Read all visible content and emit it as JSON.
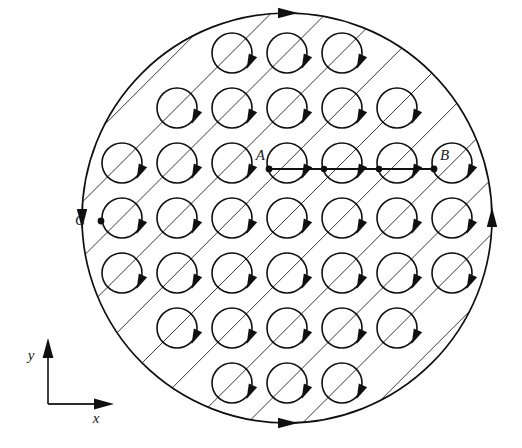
{
  "figure": {
    "background_color": "#ffffff",
    "ink_color": "#101010",
    "hatch_color": "#3a3a3a",
    "width": 522,
    "height": 448
  },
  "boundary": {
    "name": "large-circle",
    "center_x": 287,
    "center_y": 218,
    "radius": 205,
    "stroke_width": 1.7,
    "direction": "arrowheads at top, bottom, left and right of rim",
    "arrowheads": [
      {
        "at": "top",
        "angle_deg": 270,
        "points": "right"
      },
      {
        "at": "bottom",
        "angle_deg": 90,
        "points": "right"
      },
      {
        "at": "left",
        "angle_deg": 180,
        "points": "down"
      },
      {
        "at": "right",
        "angle_deg": 0,
        "points": "up"
      }
    ]
  },
  "hatching": {
    "name": "diagonal-field-lines",
    "slope": "-1",
    "angle_deg": 45,
    "perpendicular_spacing": 39,
    "count": 11,
    "stroke_width": 1
  },
  "loops": {
    "name": "current-loop-grid",
    "radius": 20,
    "spacing_x": 55,
    "spacing_y": 55,
    "origin_x": 287,
    "origin_y": 218,
    "cols": [
      -3,
      -2,
      -1,
      0,
      1,
      2,
      3
    ],
    "rows": [
      -3,
      -2,
      -1,
      0,
      1,
      2,
      3
    ],
    "circulation": "clockwise",
    "arrow_position_deg": 25
  },
  "points": [
    {
      "id": "A",
      "label": "A",
      "x": 269,
      "y": 169,
      "label_dx": -4,
      "label_dy": -9
    },
    {
      "id": "B",
      "label": "B",
      "x": 434,
      "y": 169,
      "label_dx": 6,
      "label_dy": -9
    },
    {
      "id": "C",
      "label": "C",
      "x": 101,
      "y": 221,
      "label_dx": -16,
      "label_dy": 4
    }
  ],
  "segment": {
    "name": "segment-AB",
    "from": "A",
    "to": "B",
    "x1": 269,
    "y1": 169,
    "x2": 434,
    "y2": 169,
    "stroke_width": 1.8,
    "intermediate_dots_x": [
      324,
      379
    ]
  },
  "axes": {
    "name": "coordinate-axes",
    "origin_x": 48,
    "origin_y": 404,
    "x_axis": {
      "label": "x",
      "length": 52,
      "label_x": 96,
      "label_y": 423
    },
    "y_axis": {
      "label": "y",
      "length": 52,
      "label_x": 31,
      "label_y": 360
    }
  }
}
